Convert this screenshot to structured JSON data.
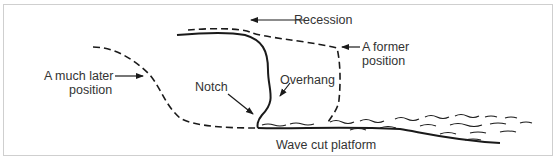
{
  "diagram": {
    "labels": {
      "recession": "Recession",
      "former_line1": "A former",
      "former_line2": "position",
      "later_line1": "A much later",
      "later_line2": "position",
      "notch": "Notch",
      "overhang": "Overhang",
      "platform": "Wave cut platform"
    },
    "colors": {
      "line": "#1a1a1a",
      "text": "#333333",
      "border": "#cfcfcf"
    }
  }
}
